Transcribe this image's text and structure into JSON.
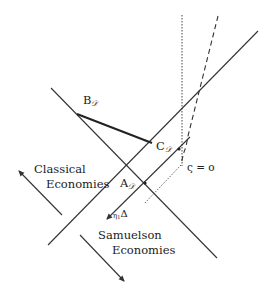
{
  "diagram": {
    "colors": {
      "line": "#333333",
      "thick": "#222222",
      "text": "#222222",
      "background": "#ffffff"
    },
    "points": {
      "B": {
        "label": "B",
        "subscript": "𝒟"
      },
      "C": {
        "label": "C",
        "subscript": "𝒟"
      },
      "A": {
        "label": "A",
        "subscript": "𝒟"
      }
    },
    "labels": {
      "zeta": "ς = o",
      "eta_delta_eta": "η",
      "eta_delta_sub": "1",
      "eta_delta_delta": "Δ",
      "classical_line1": "Classical",
      "classical_line2": "Economies",
      "samuelson_line1": "Samuelson",
      "samuelson_line2": "Economies"
    }
  }
}
